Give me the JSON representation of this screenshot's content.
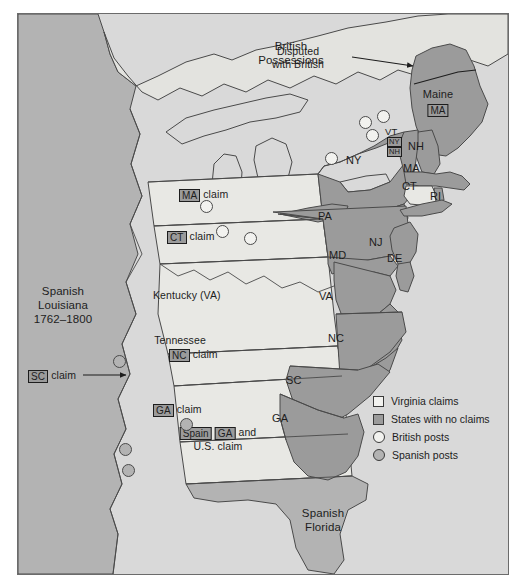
{
  "map": {
    "title_regions": [
      {
        "id": "british-possessions",
        "lines": [
          "British",
          "Possessions"
        ],
        "x": 290,
        "y": 38
      },
      {
        "id": "spanish-louisiana",
        "lines": [
          "Spanish",
          "Louisiana",
          "1762–1800"
        ],
        "x": 62,
        "y": 283
      },
      {
        "id": "spanish-florida",
        "lines": [
          "Spanish",
          "Florida"
        ],
        "x": 322,
        "y": 505
      }
    ],
    "annotations": [
      {
        "id": "disputed-with-british",
        "lines": [
          "Disputed",
          "with British"
        ],
        "x": 378,
        "y": 44
      }
    ],
    "state_labels": [
      {
        "id": "ny",
        "text": "NY",
        "x": 362,
        "y": 160
      },
      {
        "id": "pa",
        "text": "PA",
        "x": 333,
        "y": 212
      },
      {
        "id": "nj",
        "text": "NJ",
        "x": 382,
        "y": 235
      },
      {
        "id": "md",
        "text": "MD",
        "x": 342,
        "y": 248
      },
      {
        "id": "de",
        "text": "DE",
        "x": 399,
        "y": 250
      },
      {
        "id": "va",
        "text": "VA",
        "x": 331,
        "y": 288
      },
      {
        "id": "nc",
        "text": "NC",
        "x": 340,
        "y": 330
      },
      {
        "id": "sc",
        "text": "SC",
        "x": 297,
        "y": 372
      },
      {
        "id": "ga",
        "text": "GA",
        "x": 283,
        "y": 410
      },
      {
        "id": "nh",
        "text": "NH",
        "x": 417,
        "y": 138
      },
      {
        "id": "ma",
        "text": "MA",
        "x": 412,
        "y": 160
      },
      {
        "id": "ct",
        "text": "CT",
        "x": 409,
        "y": 178
      },
      {
        "id": "ri",
        "text": "RI",
        "x": 437,
        "y": 188
      },
      {
        "id": "vt",
        "text": "VT",
        "x": 393,
        "y": 124
      },
      {
        "id": "kentucky-va",
        "text": "Kentucky (VA)",
        "x": 183,
        "y": 287
      },
      {
        "id": "maine",
        "text": "Maine",
        "x": 437,
        "y": 86
      },
      {
        "id": "tennessee",
        "text": "Tennessee",
        "x": 181,
        "y": 332
      }
    ],
    "claim_labels": [
      {
        "id": "maine-ma-claim",
        "chip": "MA",
        "suffix": "",
        "x": 437,
        "y": 100,
        "centered": true
      },
      {
        "id": "ma-claim-strip",
        "chip": "MA",
        "suffix": "claim",
        "x": 178,
        "y": 186,
        "centered": false
      },
      {
        "id": "ct-claim-strip",
        "chip": "CT",
        "suffix": "claim",
        "x": 166,
        "y": 228,
        "centered": false
      },
      {
        "id": "nc-claim",
        "chip": "NC",
        "suffix": "claim",
        "x": 168,
        "y": 346,
        "centered": false
      },
      {
        "id": "sc-claim",
        "chip": "SC",
        "suffix": "claim",
        "x": 27,
        "y": 374,
        "centered": false
      },
      {
        "id": "ga-claim",
        "chip": "GA",
        "suffix": "claim",
        "x": 152,
        "y": 401,
        "centered": false
      },
      {
        "id": "vt-ny-claim",
        "chip": "NY",
        "suffix": "",
        "x": 386,
        "y": 133,
        "centered": false
      },
      {
        "id": "vt-nh-claim",
        "chip": "NH",
        "suffix": "",
        "x": 386,
        "y": 143,
        "centered": false
      }
    ],
    "compound_claim": {
      "id": "spain-ga-us-claim",
      "chip1": "Spain",
      "chip2": "GA",
      "connector": "and",
      "line2": "U.S. claim",
      "x": 143,
      "y": 425
    },
    "british_posts": [
      {
        "x": 199,
        "y": 192
      },
      {
        "x": 215,
        "y": 217
      },
      {
        "x": 243,
        "y": 224
      },
      {
        "x": 341,
        "y": 151
      },
      {
        "x": 376,
        "y": 120
      },
      {
        "x": 390,
        "y": 112
      },
      {
        "x": 383,
        "y": 130
      }
    ],
    "spanish_posts": [
      {
        "x": 112,
        "y": 349
      },
      {
        "x": 118,
        "y": 437
      },
      {
        "x": 121,
        "y": 458
      },
      {
        "x": 179,
        "y": 412
      }
    ]
  },
  "legend": {
    "items": [
      {
        "id": "virginia-claims",
        "swatch": "white-square",
        "label": "Virginia claims"
      },
      {
        "id": "states-no-claims",
        "swatch": "gray-square",
        "label": "States with no claims"
      },
      {
        "id": "british-posts",
        "swatch": "white-circle",
        "label": "British posts"
      },
      {
        "id": "spanish-posts",
        "swatch": "gray-circle",
        "label": "Spanish posts"
      }
    ]
  },
  "colors": {
    "ocean": "#d9d9d9",
    "claim_land": "#e8e8e4",
    "state_land": "#9b9b9b",
    "spanish_land": "#b3b3b3",
    "outline": "#4a4a4a",
    "text": "#1d1d1d"
  }
}
